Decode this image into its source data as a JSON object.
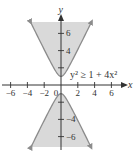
{
  "chart_data": {
    "type": "area",
    "title": "",
    "inequality": "y² ≥ 1 + 4x²",
    "xlabel": "x",
    "ylabel": "y",
    "xlim": [
      -6.5,
      7.5
    ],
    "ylim": [
      -7.5,
      7.5
    ],
    "xticks": [
      -6,
      -4,
      -2,
      0,
      2,
      4,
      6
    ],
    "xtick_labels": [
      "−6",
      "−4",
      "−2",
      "0",
      "2",
      "4",
      "6"
    ],
    "yticks": [
      6,
      4,
      -4,
      -6
    ],
    "ytick_labels": [
      "6",
      "4",
      "−4",
      "−6"
    ],
    "boundary": {
      "upper_branch": "y = sqrt(1 + 4x^2)",
      "lower_branch": "y = -sqrt(1 + 4x^2)",
      "vertices": [
        [
          0,
          1
        ],
        [
          0,
          -1
        ]
      ]
    },
    "shaded_regions": [
      "above upper branch",
      "below lower branch"
    ],
    "grid": false,
    "colors": {
      "fill": "#d9d9d9",
      "boundary": "#8c8c8c",
      "axes": "#333333"
    }
  }
}
